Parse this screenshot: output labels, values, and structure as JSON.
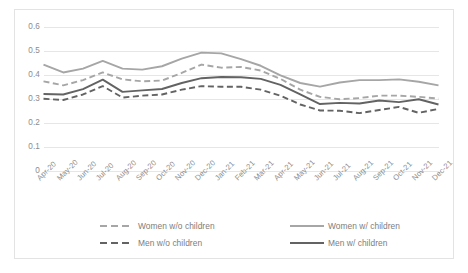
{
  "chart_data": {
    "type": "line",
    "title": "",
    "subtitle": "",
    "xlabel": "",
    "ylabel": "",
    "ylim": [
      0,
      0.6
    ],
    "grid": true,
    "legend_position": "bottom",
    "categories": [
      "Apr-20",
      "May-20",
      "Jun-20",
      "Jul-20",
      "Aug-20",
      "Sep-20",
      "Oct-20",
      "Nov-20",
      "Dec-20",
      "Jan-21",
      "Feb-21",
      "Mar-21",
      "Apr-21",
      "May-21",
      "Jun-21",
      "Jul-21",
      "Aug-21",
      "Sep-21",
      "Oct-21",
      "Nov-21",
      "Dec-21"
    ],
    "ytick_labels": [
      "0",
      "0.1",
      "0.2",
      "0.3",
      "0.4",
      "0.5",
      "0.6"
    ],
    "ytick_values": [
      0,
      0.1,
      0.2,
      0.3,
      0.4,
      0.5,
      0.6
    ],
    "series": [
      {
        "name": "Women w/o children",
        "style": "dashed",
        "color": "#a6a6a6",
        "values": [
          0.375,
          0.358,
          0.38,
          0.412,
          0.383,
          0.375,
          0.378,
          0.41,
          0.445,
          0.432,
          0.435,
          0.42,
          0.385,
          0.34,
          0.31,
          0.3,
          0.305,
          0.315,
          0.315,
          0.31,
          0.303
        ]
      },
      {
        "name": "Women w/ children",
        "style": "solid",
        "color": "#a6a6a6",
        "values": [
          0.445,
          0.412,
          0.428,
          0.46,
          0.428,
          0.424,
          0.438,
          0.47,
          0.495,
          0.492,
          0.468,
          0.44,
          0.4,
          0.368,
          0.353,
          0.37,
          0.38,
          0.38,
          0.383,
          0.373,
          0.358
        ]
      },
      {
        "name": "Men w/o children",
        "style": "dashed",
        "color": "#636363",
        "values": [
          0.302,
          0.297,
          0.32,
          0.355,
          0.307,
          0.315,
          0.32,
          0.34,
          0.355,
          0.352,
          0.352,
          0.34,
          0.315,
          0.278,
          0.253,
          0.252,
          0.242,
          0.255,
          0.268,
          0.243,
          0.26
        ]
      },
      {
        "name": "Men w/ children",
        "style": "solid",
        "color": "#636363",
        "values": [
          0.322,
          0.32,
          0.342,
          0.382,
          0.331,
          0.337,
          0.343,
          0.368,
          0.388,
          0.393,
          0.392,
          0.385,
          0.36,
          0.32,
          0.28,
          0.285,
          0.282,
          0.295,
          0.288,
          0.3,
          0.278
        ]
      }
    ]
  },
  "legend": {
    "items": [
      {
        "label": "Women w/o children",
        "style": "dashed",
        "color": "#a6a6a6"
      },
      {
        "label": "Women w/ children",
        "style": "solid",
        "color": "#a6a6a6"
      },
      {
        "label": "Men w/o children",
        "style": "dashed",
        "color": "#636363"
      },
      {
        "label": "Men w/ children",
        "style": "solid",
        "color": "#636363"
      }
    ]
  },
  "axis": {
    "gridline_color": "#e6e6e6",
    "tick_text_color": "#8c8c8c"
  },
  "frame": {
    "border_color": "#e3e3e3",
    "background": "#ffffff"
  }
}
